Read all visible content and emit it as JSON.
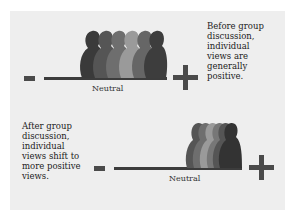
{
  "diagram": {
    "top": {
      "axis_min_symbol": "-",
      "axis_max_symbol": "+",
      "axis_label": "Neutral",
      "description_lines": [
        "Before group",
        "discussion,",
        "individual",
        "views are",
        "generally",
        "positive."
      ],
      "figure_colors": [
        "#3a3a3a",
        "#555555",
        "#6e6e6e",
        "#9a9a9a",
        "#666666",
        "#3d3d3d"
      ]
    },
    "bottom": {
      "axis_min_symbol": "-",
      "axis_max_symbol": "+",
      "axis_label": "Neutral",
      "description_lines": [
        "After group",
        "discussion,",
        "individual",
        "views shift to",
        "more positive",
        "views."
      ],
      "figure_colors": [
        "#555555",
        "#6e6e6e",
        "#9a9a9a",
        "#777777",
        "#555555",
        "#333333"
      ]
    }
  }
}
